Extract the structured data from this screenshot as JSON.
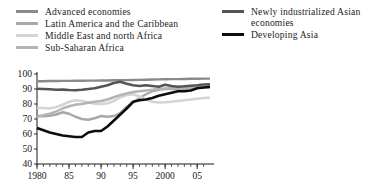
{
  "chart_data": {
    "type": "line",
    "title": "",
    "subtitle": "",
    "xlabel": "",
    "ylabel": "",
    "xlim": [
      1980,
      2007
    ],
    "ylim": [
      40,
      100
    ],
    "yticks": [
      40,
      50,
      60,
      70,
      80,
      90,
      100
    ],
    "xticks": [
      1980,
      1985,
      1990,
      1995,
      2000,
      2005
    ],
    "xtick_labels": [
      "1980",
      "85",
      "90",
      "95",
      "2000",
      "05"
    ],
    "ytick_labels": [
      "40",
      "50",
      "60",
      "70",
      "80",
      "90",
      "100"
    ],
    "minor_xticks_every": 1,
    "grid": false,
    "legend_position": "above-plot",
    "x": [
      1980,
      1981,
      1982,
      1983,
      1984,
      1985,
      1986,
      1987,
      1988,
      1989,
      1990,
      1991,
      1992,
      1993,
      1994,
      1995,
      1996,
      1997,
      1998,
      1999,
      2000,
      2001,
      2002,
      2003,
      2004,
      2005,
      2006,
      2007
    ],
    "series": [
      {
        "name": "Advanced economies",
        "color": "#8a8a8a",
        "width": 2.4,
        "values": [
          95.2,
          95.2,
          95.3,
          95.3,
          95.4,
          95.4,
          95.5,
          95.5,
          95.6,
          95.6,
          95.7,
          95.7,
          95.8,
          95.9,
          95.9,
          96.0,
          96.1,
          96.2,
          96.3,
          96.4,
          96.5,
          96.6,
          96.6,
          96.7,
          96.8,
          96.8,
          96.9,
          96.9
        ]
      },
      {
        "name": "Latin America and the Caribbean",
        "color": "#a8a8a8",
        "width": 2.4,
        "values": [
          72.0,
          71.8,
          72.2,
          73.0,
          74.5,
          73.5,
          71.5,
          70.0,
          69.5,
          70.5,
          72.0,
          71.5,
          72.0,
          74.0,
          78.0,
          81.0,
          84.0,
          86.5,
          88.5,
          89.5,
          90.0,
          90.2,
          90.0,
          90.2,
          90.5,
          90.8,
          91.0,
          91.2
        ]
      },
      {
        "name": "Middle East and north Africa",
        "color": "#d4d4d4",
        "width": 2.6,
        "values": [
          77.5,
          77.3,
          77.0,
          78.0,
          79.5,
          81.5,
          82.5,
          82.0,
          81.0,
          80.2,
          80.0,
          80.5,
          82.0,
          84.5,
          86.0,
          86.5,
          85.0,
          83.0,
          81.5,
          81.0,
          81.2,
          81.5,
          82.0,
          82.5,
          83.0,
          83.5,
          84.0,
          84.2
        ]
      },
      {
        "name": "Sub-Saharan Africa",
        "color": "#b4b4b4",
        "width": 2.4,
        "values": [
          71.5,
          72.5,
          73.5,
          75.0,
          77.0,
          78.5,
          79.5,
          80.0,
          80.8,
          81.5,
          82.0,
          83.0,
          84.5,
          86.0,
          87.0,
          88.0,
          88.5,
          89.0,
          89.5,
          90.0,
          90.3,
          90.5,
          90.6,
          90.7,
          90.8,
          90.8,
          90.9,
          91.0
        ]
      },
      {
        "name": "Newly industrialized Asian economies",
        "color": "#545454",
        "width": 2.6,
        "values": [
          90.2,
          90.0,
          89.8,
          89.5,
          89.6,
          89.3,
          89.2,
          89.5,
          90.0,
          90.5,
          91.5,
          92.5,
          94.0,
          94.8,
          93.5,
          92.5,
          92.0,
          92.5,
          92.0,
          91.5,
          92.8,
          92.0,
          91.5,
          91.8,
          92.2,
          92.5,
          93.0,
          93.2
        ]
      },
      {
        "name": "Developing Asia",
        "color": "#0d0d0d",
        "width": 2.6,
        "values": [
          64.0,
          62.5,
          61.0,
          60.0,
          59.0,
          58.5,
          58.0,
          58.0,
          61.0,
          62.0,
          62.0,
          65.0,
          69.0,
          73.0,
          77.0,
          81.5,
          82.5,
          83.0,
          84.0,
          85.5,
          86.5,
          87.5,
          88.5,
          88.5,
          89.0,
          90.5,
          91.0,
          91.5
        ]
      }
    ]
  }
}
